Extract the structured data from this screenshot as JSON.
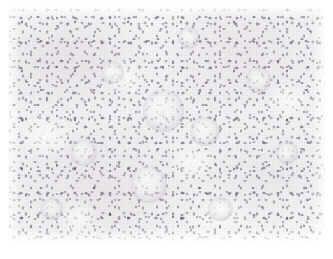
{
  "image": {
    "kind": "photomicrograph",
    "subject": "histopathology tissue section",
    "staining_appearance": "hematoxylin-predominant, pale eosin background",
    "magnification_label": "",
    "caption": "",
    "alt_text": "Dense sheet of small dark-stained round nuclei on a pale background with scattered larger pale cell clusters",
    "width_px": 333,
    "height_px": 259,
    "frame": {
      "left_px": 8,
      "top_px": 7,
      "width_px": 317,
      "height_px": 235
    },
    "colors": {
      "paper_background": "#ffffff",
      "tissue_background": "#f6f4f5",
      "pale_cytoplasm": "#ffffff",
      "nucleus_mid": "#6c6470",
      "nucleus_dark": "#2c2638",
      "cluster_rim": "#bcb7c4"
    },
    "features": [
      {
        "name": "pale-cell-cluster",
        "cx_pct": 49.0,
        "cy_pct": 42.0,
        "d_pct": 13.0
      },
      {
        "name": "pale-cell-cluster",
        "cx_pct": 44.5,
        "cy_pct": 73.5,
        "d_pct": 11.5
      },
      {
        "name": "pale-cell-cluster",
        "cx_pct": 62.0,
        "cy_pct": 53.0,
        "d_pct": 9.0
      },
      {
        "name": "pale-cell-cluster",
        "cx_pct": 24.0,
        "cy_pct": 62.0,
        "d_pct": 8.5
      },
      {
        "name": "pale-cell-cluster",
        "cx_pct": 79.0,
        "cy_pct": 31.0,
        "d_pct": 8.0
      },
      {
        "name": "pale-cell-cluster",
        "cx_pct": 33.0,
        "cy_pct": 28.0,
        "d_pct": 7.5
      },
      {
        "name": "pale-cell-cluster",
        "cx_pct": 88.0,
        "cy_pct": 62.0,
        "d_pct": 7.0
      },
      {
        "name": "pale-cell-cluster",
        "cx_pct": 67.0,
        "cy_pct": 86.0,
        "d_pct": 8.0
      },
      {
        "name": "pale-cell-cluster",
        "cx_pct": 14.0,
        "cy_pct": 86.0,
        "d_pct": 7.0
      },
      {
        "name": "pale-cell-cluster",
        "cx_pct": 57.0,
        "cy_pct": 13.0,
        "d_pct": 6.5
      }
    ]
  }
}
